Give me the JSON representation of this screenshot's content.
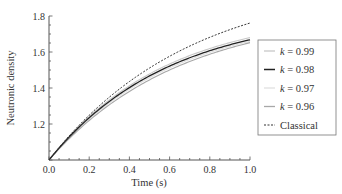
{
  "chart_data": {
    "type": "line",
    "title": "",
    "xlabel": "Time (s)",
    "ylabel": "Neutronic density",
    "xlim": [
      0.0,
      1.0
    ],
    "ylim": [
      1.0,
      1.8
    ],
    "xticks": [
      "0.0",
      "0.2",
      "0.4",
      "0.6",
      "0.8",
      "1.0"
    ],
    "yticks": [
      "1.2",
      "1.4",
      "1.6",
      "1.8"
    ],
    "grid": false,
    "legend_position": "right-outside",
    "x": [
      0.0,
      0.1,
      0.2,
      0.3,
      0.4,
      0.5,
      0.6,
      0.7,
      0.8,
      0.9,
      1.0
    ],
    "series": [
      {
        "name": "k = 0.99",
        "k": "0.99",
        "color": "#c8c8c8",
        "dash": "",
        "width": 1.1,
        "values": [
          1.0,
          1.124,
          1.232,
          1.326,
          1.408,
          1.478,
          1.54,
          1.592,
          1.637,
          1.676,
          1.68
        ]
      },
      {
        "name": "k = 0.98",
        "k": "0.98",
        "color": "#222222",
        "dash": "",
        "width": 1.3,
        "values": [
          1.0,
          1.121,
          1.227,
          1.318,
          1.398,
          1.467,
          1.527,
          1.578,
          1.623,
          1.64,
          1.668
        ]
      },
      {
        "name": "k = 0.97",
        "k": "0.97",
        "color": "#e0e0e0",
        "dash": "",
        "width": 1.1,
        "values": [
          1.0,
          1.118,
          1.222,
          1.311,
          1.389,
          1.457,
          1.515,
          1.565,
          1.608,
          1.629,
          1.66
        ]
      },
      {
        "name": "k = 0.96",
        "k": "0.96",
        "color": "#a8a8a8",
        "dash": "",
        "width": 1.1,
        "values": [
          1.0,
          1.115,
          1.216,
          1.303,
          1.379,
          1.445,
          1.502,
          1.551,
          1.593,
          1.62,
          1.652
        ]
      },
      {
        "name": "Classical",
        "color": "#333333",
        "dash": "2,1.5",
        "width": 1.0,
        "values": [
          1.0,
          1.133,
          1.249,
          1.349,
          1.435,
          1.511,
          1.576,
          1.633,
          1.682,
          1.724,
          1.761
        ]
      }
    ]
  },
  "legend": {
    "items": [
      {
        "k_label": "k",
        "eq": " = 0.99"
      },
      {
        "k_label": "k",
        "eq": " = 0.98"
      },
      {
        "k_label": "k",
        "eq": " = 0.97"
      },
      {
        "k_label": "k",
        "eq": " = 0.96"
      },
      {
        "k_label": "",
        "eq": "Classical"
      }
    ]
  }
}
